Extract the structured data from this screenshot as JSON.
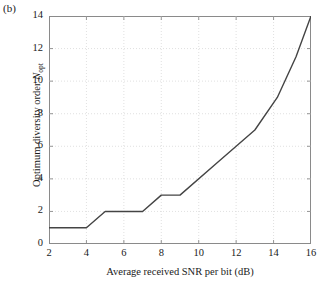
{
  "panel": {
    "label": "(b)"
  },
  "axes": {
    "xlabel": "Average received SNR per bit (dB)",
    "ylabel_main": "Optimum diversity order ",
    "ylabel_symbol": "N",
    "ylabel_subscript": "opt",
    "xticks": [
      2,
      4,
      6,
      8,
      10,
      12,
      14,
      16
    ],
    "yticks": [
      0,
      2,
      4,
      6,
      8,
      10,
      12,
      14
    ],
    "xlim": [
      2,
      16
    ],
    "ylim": [
      0,
      14
    ]
  },
  "style": {
    "line_color": "#444444",
    "grid_color": "#d8d8d8",
    "frame_color": "#8a8a8a",
    "background": "#ffffff",
    "text_color": "#1a1a1a"
  },
  "chart_data": {
    "type": "line",
    "title": "",
    "subtitle": "",
    "xlabel": "Average received SNR per bit (dB)",
    "ylabel": "Optimum diversity order N_opt",
    "xlim": [
      2,
      16
    ],
    "ylim": [
      0,
      14
    ],
    "xticks": [
      2,
      4,
      6,
      8,
      10,
      12,
      14,
      16
    ],
    "yticks": [
      0,
      2,
      4,
      6,
      8,
      10,
      12,
      14
    ],
    "grid": "dotted",
    "legend": "none",
    "annotations": [
      "(b)"
    ],
    "series": [
      {
        "name": "Optimum diversity order",
        "color": "#444444",
        "x": [
          2,
          4,
          5,
          7,
          8,
          9,
          11,
          13,
          14.2,
          15.2,
          16
        ],
        "y": [
          1,
          1,
          2,
          2,
          3,
          3,
          5,
          7,
          9,
          11.5,
          14
        ]
      }
    ]
  }
}
